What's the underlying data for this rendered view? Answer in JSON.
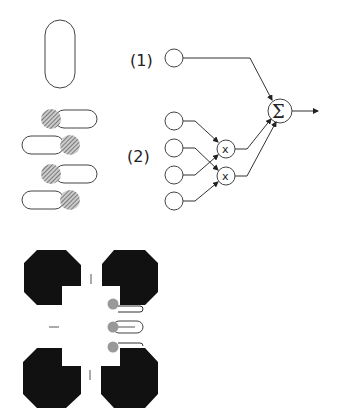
{
  "figure": {
    "labels": {
      "term1": "(1)",
      "term2": "(2)",
      "multiply": "x",
      "sum": "Σ"
    },
    "panels": [
      {
        "name": "single-rod",
        "description": "Single elongated rounded cell (capsule)"
      },
      {
        "name": "paired-rods",
        "description": "Four capsules each with one hatched circular end, alternating left/right"
      },
      {
        "name": "network",
        "description": "Input (1) connects directly to summation; four inputs (2) pairwise multiplied then summed"
      },
      {
        "name": "octagon-arrangement",
        "description": "Four black octagonal blocks with notched corners around small capsules with gray circular ends"
      }
    ],
    "colors": {
      "stroke": "#444444",
      "fill_black": "#111111",
      "hatch": "#777777",
      "gray_dot": "#999999",
      "background": "#ffffff"
    }
  }
}
